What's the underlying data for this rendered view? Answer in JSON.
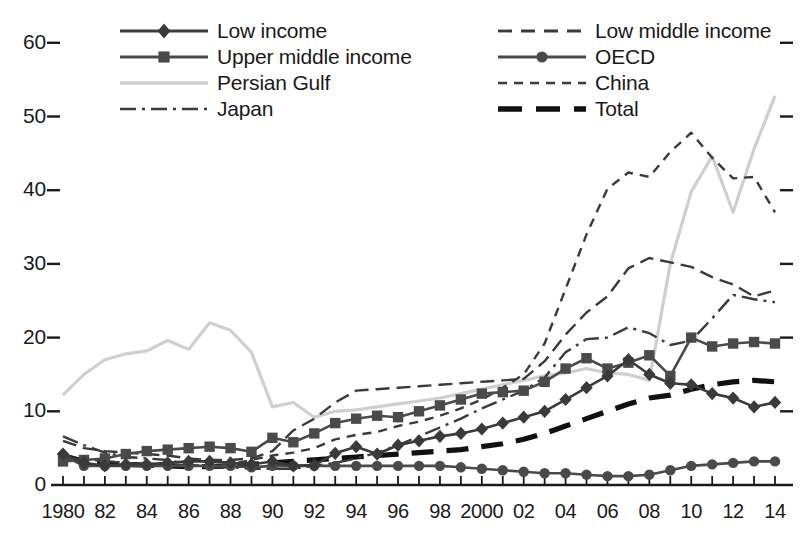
{
  "chart_data": {
    "type": "line",
    "title": "",
    "xlabel": "",
    "ylabel": "",
    "grid": false,
    "legend_position": "top",
    "xlim": [
      1980,
      2014
    ],
    "ylim": [
      0,
      62
    ],
    "yticks": [
      0,
      10,
      20,
      30,
      40,
      50,
      60
    ],
    "x": [
      1980,
      1981,
      1982,
      1983,
      1984,
      1985,
      1986,
      1987,
      1988,
      1989,
      1990,
      1991,
      1992,
      1993,
      1994,
      1995,
      1996,
      1997,
      1998,
      1999,
      2000,
      2001,
      2002,
      2003,
      2004,
      2005,
      2006,
      2007,
      2008,
      2009,
      2010,
      2011,
      2012,
      2013,
      2014
    ],
    "xtick_labels": [
      "1980",
      "82",
      "84",
      "86",
      "88",
      "90",
      "92",
      "94",
      "96",
      "98",
      "2000",
      "02",
      "04",
      "06",
      "08",
      "10",
      "12",
      "14"
    ],
    "xtick_values": [
      1980,
      1982,
      1984,
      1986,
      1988,
      1990,
      1992,
      1994,
      1996,
      1998,
      2000,
      2002,
      2004,
      2006,
      2008,
      2010,
      2012,
      2014
    ],
    "series": [
      {
        "name": "Low income",
        "marker": "diamond",
        "dash": "solid",
        "color": "#3a3a3a",
        "values": [
          4.2,
          3.0,
          2.6,
          2.8,
          2.8,
          3.0,
          3.2,
          3.2,
          3.0,
          2.8,
          3.2,
          2.6,
          2.7,
          4.3,
          5.2,
          4.2,
          5.4,
          6.0,
          6.6,
          7.0,
          7.6,
          8.4,
          9.2,
          10.0,
          11.6,
          13.2,
          14.8,
          17.0,
          15.0,
          13.8,
          13.6,
          12.4,
          11.8,
          10.6,
          11.2
        ]
      },
      {
        "name": "Upper middle income",
        "marker": "square",
        "dash": "solid",
        "color": "#4a4a4a",
        "values": [
          3.2,
          3.4,
          3.6,
          4.2,
          4.6,
          4.8,
          5.0,
          5.2,
          5.0,
          4.5,
          6.4,
          5.8,
          7.0,
          8.4,
          9.0,
          9.4,
          9.2,
          10.0,
          10.8,
          11.6,
          12.4,
          12.6,
          12.8,
          14.0,
          15.8,
          17.2,
          15.8,
          16.6,
          17.6,
          14.8,
          20.0,
          18.8,
          19.2,
          19.4,
          19.2
        ]
      },
      {
        "name": "Persian Gulf",
        "marker": "none",
        "dash": "solid",
        "color": "#cfcfcf",
        "values": [
          12.2,
          15.0,
          17.0,
          17.8,
          18.2,
          19.6,
          18.4,
          22.0,
          21.0,
          18.0,
          10.6,
          11.2,
          9.2,
          10.0,
          10.2,
          10.6,
          11.0,
          11.4,
          11.8,
          12.4,
          13.0,
          13.6,
          14.2,
          14.8,
          15.2,
          15.8,
          15.2,
          15.0,
          14.2,
          30.0,
          39.8,
          44.6,
          37.0,
          45.6,
          52.8
        ]
      },
      {
        "name": "Japan",
        "marker": "none",
        "dash": "dashdot",
        "color": "#3a3a3a",
        "values": [
          6.6,
          5.4,
          4.4,
          3.8,
          3.6,
          3.4,
          2.8,
          2.4,
          2.4,
          2.2,
          2.2,
          2.2,
          2.6,
          3.0,
          3.6,
          4.4,
          5.4,
          6.6,
          7.8,
          9.0,
          10.4,
          11.6,
          12.8,
          14.6,
          18.0,
          19.8,
          20.0,
          21.4,
          20.6,
          19.0,
          19.6,
          22.6,
          25.8,
          25.2,
          24.8
        ]
      },
      {
        "name": "Low middle income",
        "marker": "none",
        "dash": "dashed-long",
        "color": "#3a3a3a",
        "values": [
          6.0,
          5.0,
          4.6,
          4.4,
          4.2,
          4.0,
          3.6,
          3.4,
          3.4,
          3.6,
          4.6,
          7.4,
          9.0,
          11.2,
          12.8,
          13.0,
          13.2,
          13.4,
          13.6,
          13.8,
          14.0,
          14.2,
          14.4,
          16.8,
          20.4,
          23.4,
          25.6,
          29.4,
          30.8,
          30.2,
          29.6,
          28.2,
          27.2,
          25.6,
          26.4
        ]
      },
      {
        "name": "OECD",
        "marker": "circle",
        "dash": "solid",
        "color": "#4a4a4a",
        "values": [
          4.0,
          2.6,
          2.6,
          2.6,
          2.6,
          2.6,
          2.6,
          2.6,
          2.6,
          2.4,
          2.6,
          2.6,
          2.6,
          2.6,
          2.6,
          2.6,
          2.6,
          2.6,
          2.6,
          2.4,
          2.2,
          2.0,
          1.8,
          1.6,
          1.6,
          1.4,
          1.2,
          1.2,
          1.4,
          2.0,
          2.6,
          2.8,
          3.0,
          3.2,
          3.2
        ]
      },
      {
        "name": "China",
        "marker": "none",
        "dash": "dashed-short",
        "color": "#3a3a3a",
        "values": [
          4.0,
          3.6,
          3.2,
          3.0,
          2.8,
          2.8,
          2.6,
          2.6,
          2.8,
          3.4,
          4.0,
          4.4,
          5.0,
          6.2,
          6.8,
          7.2,
          8.0,
          8.6,
          9.4,
          10.4,
          11.6,
          13.2,
          15.0,
          19.2,
          26.6,
          34.0,
          40.2,
          42.4,
          41.8,
          45.2,
          47.8,
          44.4,
          41.6,
          41.8,
          37.0
        ]
      },
      {
        "name": "Total",
        "marker": "none",
        "dash": "dashed-heavy",
        "color": "#111111",
        "values": [
          4.0,
          3.2,
          3.0,
          2.8,
          2.7,
          2.6,
          2.5,
          2.5,
          2.6,
          2.8,
          3.0,
          3.2,
          3.4,
          3.6,
          3.8,
          4.0,
          4.2,
          4.4,
          4.6,
          4.8,
          5.2,
          5.6,
          6.2,
          7.0,
          8.0,
          9.0,
          10.0,
          11.0,
          11.8,
          12.2,
          13.0,
          13.6,
          14.0,
          14.2,
          14.0
        ]
      }
    ]
  },
  "legend": {
    "left_column": [
      {
        "label": "Low income",
        "swatch": "line-diamond"
      },
      {
        "label": "Upper middle income",
        "swatch": "line-square"
      },
      {
        "label": "Persian Gulf",
        "swatch": "line-light"
      },
      {
        "label": "Japan",
        "swatch": "line-dashdot"
      }
    ],
    "right_column": [
      {
        "label": "Low middle income",
        "swatch": "line-dashed-long"
      },
      {
        "label": "OECD",
        "swatch": "line-circle"
      },
      {
        "label": "China",
        "swatch": "line-dashed-short"
      },
      {
        "label": "Total",
        "swatch": "line-dashed-heavy"
      }
    ]
  },
  "colors": {
    "axis": "#1a1a1a",
    "dark_line": "#3a3a3a",
    "marker_line": "#4a4a4a",
    "light_line": "#cfcfcf",
    "total_line": "#111111",
    "background": "#ffffff"
  }
}
